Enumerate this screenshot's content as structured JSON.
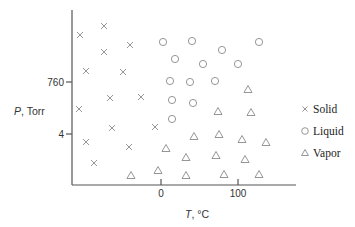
{
  "chart_data": {
    "type": "scatter",
    "title": "",
    "xlabel": "T, °C",
    "ylabel": "P, Torr",
    "x_ticks": [
      {
        "label": "0",
        "px": 161
      },
      {
        "label": "100",
        "px": 238
      }
    ],
    "y_ticks": [
      {
        "label": "760",
        "px": 82
      },
      {
        "label": "4",
        "px": 134
      }
    ],
    "grid": false,
    "legend_position": "right",
    "legend": [
      {
        "name": "Solid",
        "marker": "cross"
      },
      {
        "name": "Liquid",
        "marker": "circle"
      },
      {
        "name": "Vapor",
        "marker": "triangle"
      }
    ],
    "series": [
      {
        "name": "Solid",
        "marker": "cross",
        "points_px": [
          [
            80,
            35
          ],
          [
            104,
            26
          ],
          [
            104,
            52
          ],
          [
            130,
            45
          ],
          [
            86,
            71
          ],
          [
            123,
            72
          ],
          [
            110,
            98
          ],
          [
            141,
            97
          ],
          [
            79,
            109
          ],
          [
            86,
            142
          ],
          [
            112,
            128
          ],
          [
            155,
            127
          ],
          [
            129,
            147
          ],
          [
            94,
            163
          ]
        ]
      },
      {
        "name": "Liquid",
        "marker": "circle",
        "points_px": [
          [
            163,
            42
          ],
          [
            192,
            41
          ],
          [
            222,
            50
          ],
          [
            259,
            42
          ],
          [
            175,
            59
          ],
          [
            203,
            64
          ],
          [
            238,
            64
          ],
          [
            170,
            81
          ],
          [
            190,
            82
          ],
          [
            215,
            81
          ],
          [
            172,
            100
          ],
          [
            193,
            103
          ],
          [
            172,
            119
          ]
        ]
      },
      {
        "name": "Vapor",
        "marker": "triangle",
        "points_px": [
          [
            248,
            89
          ],
          [
            251,
            112
          ],
          [
            218,
            111
          ],
          [
            194,
            136
          ],
          [
            219,
            134
          ],
          [
            242,
            139
          ],
          [
            266,
            142
          ],
          [
            166,
            148
          ],
          [
            186,
            157
          ],
          [
            216,
            155
          ],
          [
            245,
            159
          ],
          [
            158,
            170
          ],
          [
            186,
            175
          ],
          [
            224,
            174
          ],
          [
            259,
            174
          ],
          [
            131,
            175
          ]
        ]
      }
    ]
  },
  "axes": {
    "xlabel": "T, °C",
    "ylabel": "P, Torr",
    "x_tick_0": "0",
    "x_tick_100": "100",
    "y_tick_760": "760",
    "y_tick_4": "4"
  },
  "legend": {
    "solid": "Solid",
    "liquid": "Liquid",
    "vapor": "Vapor"
  }
}
